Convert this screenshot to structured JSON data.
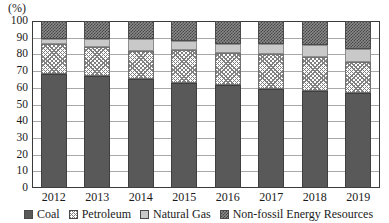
{
  "chart_data": {
    "type": "bar",
    "subtype": "stacked-100-percent",
    "title": "",
    "xlabel": "",
    "ylabel": "(%)",
    "ylim": [
      0,
      100
    ],
    "yticks": [
      0,
      10,
      20,
      30,
      40,
      50,
      60,
      70,
      80,
      90,
      100
    ],
    "grid": true,
    "legend_position": "bottom",
    "categories": [
      "2012",
      "2013",
      "2014",
      "2015",
      "2016",
      "2017",
      "2018",
      "2019"
    ],
    "series": [
      {
        "name": "Coal",
        "values": [
          68.0,
          67.0,
          65.0,
          63.0,
          61.5,
          59.5,
          58.0,
          57.0
        ]
      },
      {
        "name": "Petroleum",
        "values": [
          18.0,
          17.5,
          17.0,
          19.5,
          19.5,
          21.0,
          20.5,
          18.5
        ]
      },
      {
        "name": "Natural Gas",
        "values": [
          3.0,
          5.0,
          7.0,
          5.5,
          5.5,
          5.5,
          7.0,
          7.5
        ]
      },
      {
        "name": "Non-fossil Energy Resources",
        "values": [
          11.0,
          10.5,
          11.0,
          12.0,
          13.5,
          14.0,
          14.5,
          17.0
        ]
      }
    ],
    "series_patterns": [
      "solid-dark",
      "diagonal-hatch",
      "light-gray",
      "checkerboard"
    ],
    "series_colors": [
      "#595959",
      "#808080",
      "#c9c9c9",
      "#6a6a6a"
    ]
  },
  "axis": {
    "unit_label": "(%)",
    "y_tick_labels": [
      "100",
      "90",
      "80",
      "70",
      "60",
      "50",
      "40",
      "30",
      "20",
      "10",
      "0"
    ],
    "x_tick_labels": [
      "2012",
      "2013",
      "2014",
      "2015",
      "2016",
      "2017",
      "2018",
      "2019"
    ]
  },
  "legend": {
    "items": [
      {
        "label": "Coal",
        "swatch": "solid-dark-swatch"
      },
      {
        "label": "Petroleum",
        "swatch": "diagonal-hatch-swatch"
      },
      {
        "label": "Natural Gas",
        "swatch": "light-gray-swatch"
      },
      {
        "label": "Non-fossil Energy Resources",
        "swatch": "checkerboard-swatch"
      }
    ]
  }
}
